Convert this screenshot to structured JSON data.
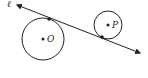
{
  "diagram": {
    "line": {
      "label": "ℓ",
      "start": [
        17,
        5
      ],
      "end": [
        140,
        53
      ]
    },
    "circles": [
      {
        "label": "O",
        "center": [
          43,
          39
        ],
        "radius": 21,
        "tangent_point": [
          49,
          19
        ]
      },
      {
        "label": "P",
        "center": [
          108,
          25
        ],
        "radius": 14,
        "tangent_point": [
          102,
          37
        ]
      }
    ],
    "colors": {
      "stroke": "#222222",
      "background": "#ffffff"
    }
  }
}
